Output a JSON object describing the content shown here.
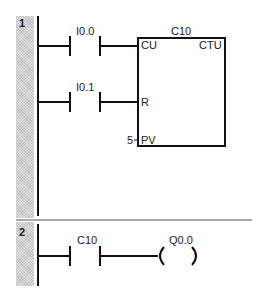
{
  "networks": [
    {
      "number": "1",
      "contacts": [
        {
          "address": "I0.0",
          "type": "normally-open"
        },
        {
          "address": "I0.1",
          "type": "normally-open"
        }
      ],
      "counter_box": {
        "name": "C10",
        "type": "CTU",
        "inputs": {
          "cu": "CU",
          "r": "R",
          "pv": "PV"
        },
        "preset_value": "5"
      }
    },
    {
      "number": "2",
      "contacts": [
        {
          "address": "C10",
          "type": "normally-open"
        }
      ],
      "coil": {
        "address": "Q0.0",
        "type": "output-coil"
      }
    }
  ],
  "colors": {
    "line": "#111111",
    "strip": "#cfcfcf",
    "separator": "#a8a8a8"
  }
}
